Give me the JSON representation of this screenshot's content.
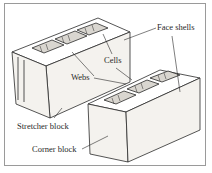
{
  "diagram": {
    "labels": {
      "face_shells": "Face shells",
      "cells": "Cells",
      "webs": "Webs",
      "stretcher_block": "Stretcher block",
      "corner_block": "Corner block"
    },
    "colors": {
      "line": "#2a2a2a",
      "face": "#f4f2ee",
      "top": "#ffffff",
      "shade": "#bdbab4",
      "border": "#9a9a9a"
    }
  }
}
